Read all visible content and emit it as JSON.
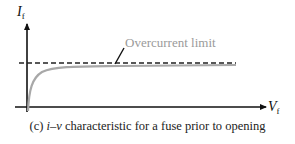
{
  "figure": {
    "y_axis_label": {
      "main": "I",
      "sub": "f"
    },
    "x_axis_label": {
      "main": "V",
      "sub": "f"
    },
    "annotation": "Overcurrent limit",
    "caption": {
      "prefix": "(c) ",
      "italic": "i–v",
      "rest": " characteristic for a fuse prior to opening"
    },
    "colors": {
      "axes": "#111111",
      "curve": "#a8a8a8",
      "dashed_limit": "#222222",
      "annotation_text": "#9a9a9a",
      "caption_text": "#222222"
    }
  }
}
